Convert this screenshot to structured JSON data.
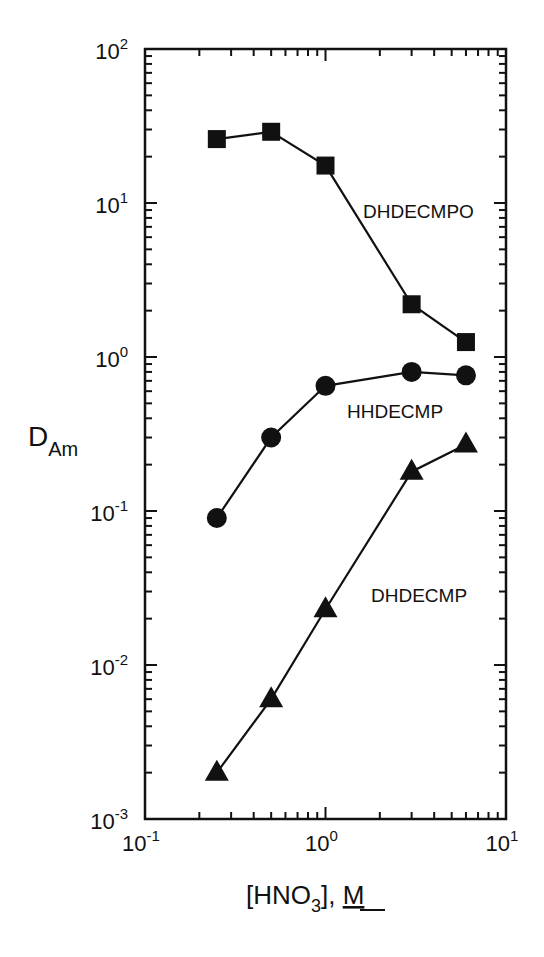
{
  "chart_data": {
    "type": "line",
    "title": "",
    "xlabel": "[HNO3], M",
    "ylabel": "D_Am",
    "xscale": "log",
    "yscale": "log",
    "xlim": [
      0.1,
      10
    ],
    "ylim": [
      0.001,
      100
    ],
    "grid": false,
    "legend": "inline labels",
    "x_ticks": [
      {
        "value": 0.1,
        "base": "10",
        "exp": "-1"
      },
      {
        "value": 1,
        "base": "10",
        "exp": "0"
      },
      {
        "value": 10,
        "base": "10",
        "exp": "1"
      }
    ],
    "y_ticks": [
      {
        "value": 100,
        "base": "10",
        "exp": "2"
      },
      {
        "value": 10,
        "base": "10",
        "exp": "1"
      },
      {
        "value": 1,
        "base": "10",
        "exp": "0"
      },
      {
        "value": 0.1,
        "base": "10",
        "exp": "-1"
      },
      {
        "value": 0.01,
        "base": "10",
        "exp": "-2"
      },
      {
        "value": 0.001,
        "base": "10",
        "exp": "-3"
      }
    ],
    "x": [
      0.25,
      0.5,
      1.0,
      3.0,
      6.0
    ],
    "series": [
      {
        "name": "DHDECMPO",
        "marker": "square",
        "values": [
          26,
          29,
          17.5,
          2.2,
          1.25
        ],
        "label_pos": {
          "x": 363,
          "y": 218
        }
      },
      {
        "name": "HHDECMP",
        "marker": "circle",
        "values": [
          0.09,
          0.3,
          0.65,
          0.8,
          0.76
        ],
        "label_pos": {
          "x": 347,
          "y": 418
        }
      },
      {
        "name": "DHDECMP",
        "marker": "triangle",
        "values": [
          0.002,
          0.006,
          0.023,
          0.18,
          0.27
        ],
        "label_pos": {
          "x": 371,
          "y": 602
        }
      }
    ]
  },
  "axis_labels": {
    "y_main": "D",
    "y_sub": "Am",
    "x_pre": "[HNO",
    "x_sub": "3",
    "x_post": "], ",
    "x_unit": "M"
  }
}
